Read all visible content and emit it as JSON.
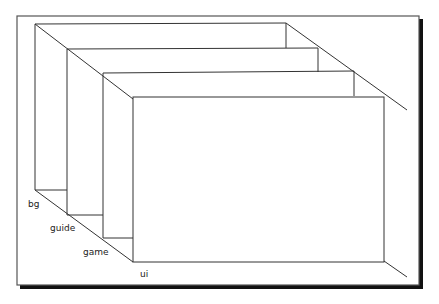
{
  "diagram": {
    "type": "layer-stack",
    "layers": [
      {
        "name": "bg",
        "label": "bg"
      },
      {
        "name": "guide",
        "label": "guide"
      },
      {
        "name": "game",
        "label": "game"
      },
      {
        "name": "ui",
        "label": "ui"
      }
    ],
    "colors": {
      "line": "#333333",
      "frame_shadow": "#111111",
      "background": "#ffffff"
    }
  }
}
